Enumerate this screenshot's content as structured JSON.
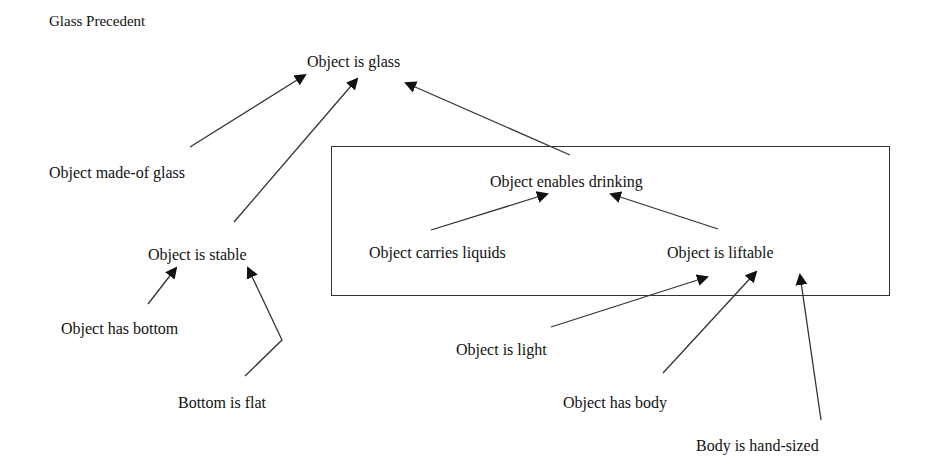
{
  "diagram": {
    "title": "Glass Precedent",
    "group_box": {
      "label": "drinking-subgraph"
    },
    "nodes": {
      "object_is_glass": "Object is glass",
      "object_made_of_glass": "Object made-of glass",
      "object_enables_drinking": "Object enables drinking",
      "object_is_stable": "Object is stable",
      "object_carries_liquids": "Object carries liquids",
      "object_is_liftable": "Object is liftable",
      "object_has_bottom": "Object has bottom",
      "object_is_light": "Object is light",
      "bottom_is_flat": "Bottom is flat",
      "object_has_body": "Object has body",
      "body_is_hand_sized": "Body is hand-sized"
    },
    "edges": [
      {
        "from": "Object made-of glass",
        "to": "Object is glass"
      },
      {
        "from": "Object is stable",
        "to": "Object is glass"
      },
      {
        "from": "Object enables drinking",
        "to": "Object is glass"
      },
      {
        "from": "Object carries liquids",
        "to": "Object enables drinking"
      },
      {
        "from": "Object is liftable",
        "to": "Object enables drinking"
      },
      {
        "from": "Object has bottom",
        "to": "Object is stable"
      },
      {
        "from": "Bottom is flat",
        "to": "Object is stable"
      },
      {
        "from": "Object is light",
        "to": "Object is liftable"
      },
      {
        "from": "Object has body",
        "to": "Object is liftable"
      },
      {
        "from": "Body is hand-sized",
        "to": "Object is liftable"
      }
    ],
    "colors": {
      "line": "#333333",
      "text": "#111111",
      "background": "#ffffff"
    }
  }
}
